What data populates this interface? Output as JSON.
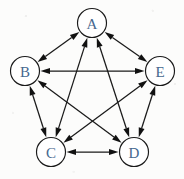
{
  "figure": {
    "kind": "node-link-diagram",
    "background_color": "#fcfcfb",
    "node_fill": "#ffffff",
    "node_stroke": "#1a1a1a",
    "label_color": "#46688f",
    "edge_color": "#1a1a1a",
    "node_radius": 14.5,
    "width": 184,
    "height": 179
  },
  "nodes": [
    {
      "id": "A",
      "label": "A",
      "x": 92,
      "y": 23
    },
    {
      "id": "B",
      "label": "B",
      "x": 25,
      "y": 71
    },
    {
      "id": "E",
      "label": "E",
      "x": 160,
      "y": 71
    },
    {
      "id": "C",
      "label": "C",
      "x": 51,
      "y": 152
    },
    {
      "id": "D",
      "label": "D",
      "x": 134,
      "y": 152
    }
  ],
  "edges": [
    {
      "from": "A",
      "to": "B",
      "arrows": "both"
    },
    {
      "from": "A",
      "to": "E",
      "arrows": "both"
    },
    {
      "from": "A",
      "to": "C",
      "arrows": "both"
    },
    {
      "from": "A",
      "to": "D",
      "arrows": "both"
    },
    {
      "from": "B",
      "to": "E",
      "arrows": "both"
    },
    {
      "from": "B",
      "to": "C",
      "arrows": "both"
    },
    {
      "from": "B",
      "to": "D",
      "arrows": "both"
    },
    {
      "from": "E",
      "to": "C",
      "arrows": "both"
    },
    {
      "from": "E",
      "to": "D",
      "arrows": "both"
    },
    {
      "from": "C",
      "to": "D",
      "arrows": "both"
    }
  ]
}
